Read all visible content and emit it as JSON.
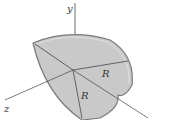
{
  "figure": {
    "axes": {
      "y": "y",
      "z": "z"
    },
    "labels": {
      "radius_1": "R",
      "radius_2": "R"
    },
    "colors": {
      "surface": "#c8c8c8",
      "rim": "#9a9a9a",
      "line": "#333333"
    }
  }
}
